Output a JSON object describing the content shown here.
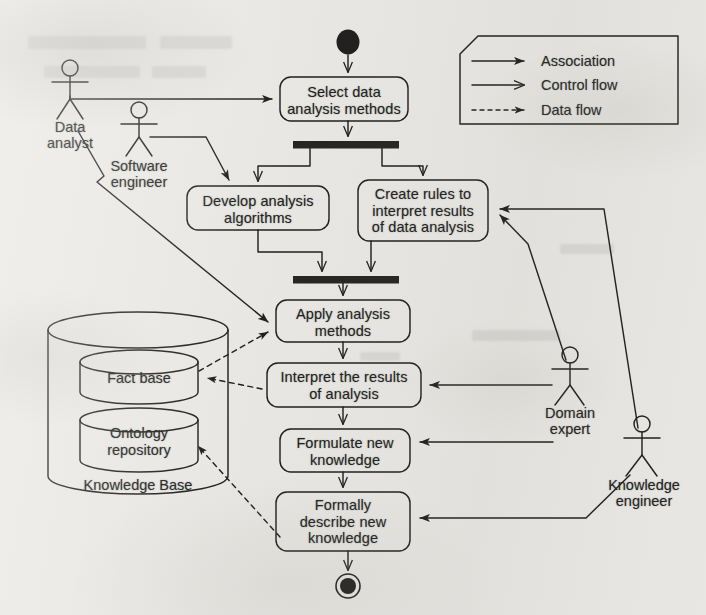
{
  "diagram": {
    "type": "uml-activity-diagram",
    "initial_node": {
      "name": "start",
      "cx": 348,
      "cy": 42,
      "r": 11
    },
    "final_node": {
      "name": "end",
      "cx": 348,
      "cy": 586,
      "r_outer": 12,
      "r_inner": 8
    },
    "activities": [
      {
        "id": "select",
        "label": "Select data\nanalysis methods",
        "x": 280,
        "y": 77,
        "w": 128,
        "h": 44
      },
      {
        "id": "develop",
        "label": "Develop analysis\nalgorithms",
        "x": 187,
        "y": 186,
        "w": 142,
        "h": 44
      },
      {
        "id": "create",
        "label": "Create rules to\ninterpret results\nof data analysis",
        "x": 358,
        "y": 180,
        "w": 130,
        "h": 61
      },
      {
        "id": "apply",
        "label": "Apply analysis\nmethods",
        "x": 276,
        "y": 300,
        "w": 134,
        "h": 42
      },
      {
        "id": "interpret",
        "label": "Interpret the results\nof analysis",
        "x": 267,
        "y": 363,
        "w": 154,
        "h": 44
      },
      {
        "id": "formulate",
        "label": "Formulate new\nknowledge",
        "x": 280,
        "y": 429,
        "w": 130,
        "h": 43
      },
      {
        "id": "formally",
        "label": "Formally\ndescribe new\nknowledge",
        "x": 276,
        "y": 492,
        "w": 134,
        "h": 59
      }
    ],
    "bars": [
      {
        "id": "fork",
        "name": "fork-bar",
        "x": 293,
        "y": 141,
        "w": 106,
        "h": 7
      },
      {
        "id": "join",
        "name": "join-bar",
        "x": 293,
        "y": 276,
        "w": 106,
        "h": 7
      }
    ],
    "actors": [
      {
        "id": "data-analyst",
        "label": "Data\nanalyst",
        "cx": 70,
        "cy": 82,
        "label_x": 70,
        "label_y": 116
      },
      {
        "id": "software-engineer",
        "label": "Software\nengineer",
        "cx": 139,
        "cy": 123,
        "label_x": 139,
        "label_y": 157
      },
      {
        "id": "domain-expert",
        "label": "Domain\nexpert",
        "cx": 570,
        "cy": 368,
        "label_x": 570,
        "label_y": 402
      },
      {
        "id": "knowledge-engineer",
        "label": "Knowledge\nengineer",
        "cx": 642,
        "cy": 437,
        "label_x": 644,
        "label_y": 473
      }
    ],
    "datastore": {
      "name": "knowledge-base",
      "label": "Knowledge Base",
      "x": 48,
      "y": 312,
      "w": 180,
      "h": 182,
      "inner": [
        {
          "id": "fact-base",
          "label": "Fact base",
          "x": 80,
          "y": 350,
          "w": 118,
          "h": 54
        },
        {
          "id": "ontology-repository",
          "label": "Ontology\nrepository",
          "x": 80,
          "y": 408,
          "w": 118,
          "h": 62
        }
      ]
    },
    "legend": {
      "name": "legend-note",
      "x": 460,
      "y": 36,
      "w": 218,
      "h": 88,
      "corner": 18,
      "items": [
        {
          "id": "association",
          "label": "Association",
          "style": "solid",
          "arrow": "filled"
        },
        {
          "id": "control-flow",
          "label": "Control flow",
          "style": "solid",
          "arrow": "open"
        },
        {
          "id": "data-flow",
          "label": "Data flow",
          "style": "dashed",
          "arrow": "filled"
        }
      ]
    },
    "edges": [
      {
        "from": "start",
        "to": "select",
        "kind": "control-flow"
      },
      {
        "from": "select",
        "to": "fork",
        "kind": "control-flow"
      },
      {
        "from": "fork",
        "to": "develop",
        "kind": "control-flow"
      },
      {
        "from": "fork",
        "to": "create",
        "kind": "control-flow"
      },
      {
        "from": "develop",
        "to": "join",
        "kind": "control-flow"
      },
      {
        "from": "create",
        "to": "join",
        "kind": "control-flow"
      },
      {
        "from": "join",
        "to": "apply",
        "kind": "control-flow"
      },
      {
        "from": "apply",
        "to": "interpret",
        "kind": "control-flow"
      },
      {
        "from": "interpret",
        "to": "formulate",
        "kind": "control-flow"
      },
      {
        "from": "formulate",
        "to": "formally",
        "kind": "control-flow"
      },
      {
        "from": "formally",
        "to": "end",
        "kind": "control-flow"
      },
      {
        "from": "data-analyst",
        "to": "select",
        "kind": "association"
      },
      {
        "from": "data-analyst",
        "to": "apply",
        "kind": "association"
      },
      {
        "from": "software-engineer",
        "to": "develop",
        "kind": "association"
      },
      {
        "from": "domain-expert",
        "to": "create",
        "kind": "association"
      },
      {
        "from": "domain-expert",
        "to": "interpret",
        "kind": "association"
      },
      {
        "from": "domain-expert",
        "to": "formulate",
        "kind": "association"
      },
      {
        "from": "knowledge-engineer",
        "to": "create",
        "kind": "association"
      },
      {
        "from": "knowledge-engineer",
        "to": "formally",
        "kind": "association"
      },
      {
        "from": "fact-base",
        "to": "apply",
        "kind": "data-flow"
      },
      {
        "from": "interpret",
        "to": "fact-base",
        "kind": "data-flow"
      },
      {
        "from": "formally",
        "to": "ontology-repository",
        "kind": "data-flow"
      }
    ],
    "colors": {
      "ink": "#201f1d",
      "paper": "#e9e7e3",
      "bar_fill": "#262523"
    }
  },
  "labels": {
    "select": {
      "l1": "Select data",
      "l2": "analysis methods"
    },
    "develop": {
      "l1": "Develop analysis",
      "l2": "algorithms"
    },
    "create": {
      "l1": "Create rules to",
      "l2": "interpret results",
      "l3": "of data analysis"
    },
    "apply": {
      "l1": "Apply analysis",
      "l2": "methods"
    },
    "interpret": {
      "l1": "Interpret the results",
      "l2": "of analysis"
    },
    "formulate": {
      "l1": "Formulate new",
      "l2": "knowledge"
    },
    "formally": {
      "l1": "Formally",
      "l2": "describe new",
      "l3": "knowledge"
    },
    "actor_data_analyst": {
      "l1": "Data",
      "l2": "analyst"
    },
    "actor_software_engineer": {
      "l1": "Software",
      "l2": "engineer"
    },
    "actor_domain_expert": {
      "l1": "Domain",
      "l2": "expert"
    },
    "actor_knowledge_engineer": {
      "l1": "Knowledge",
      "l2": "engineer"
    },
    "fact_base": {
      "l1": "Fact base"
    },
    "ontology": {
      "l1": "Ontology",
      "l2": "repository"
    },
    "kb": {
      "l1": "Knowledge Base"
    },
    "legend_association": "Association",
    "legend_control_flow": "Control flow",
    "legend_data_flow": "Data flow"
  }
}
